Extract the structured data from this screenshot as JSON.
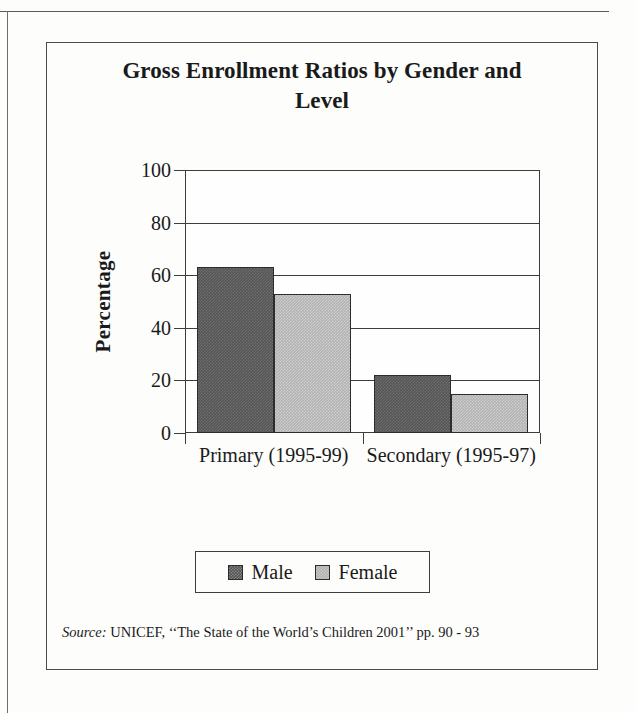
{
  "chart_data": {
    "type": "bar",
    "title": "Gross Enrollment Ratios by Gender and Level",
    "title_line1": "Gross Enrollment Ratios by Gender and",
    "title_line2": "Level",
    "xlabel": "",
    "ylabel": "Percentage",
    "ylim": [
      0,
      100
    ],
    "ytick_labels": [
      "100",
      "80",
      "60",
      "40",
      "20",
      "0"
    ],
    "yticks": [
      100,
      80,
      60,
      40,
      20,
      0
    ],
    "grid": true,
    "legend_position": "bottom-center",
    "categories": [
      "Primary (1995-99)",
      "Secondary (1995-97)"
    ],
    "series": [
      {
        "name": "Male",
        "color": "#565656",
        "values": [
          63,
          22
        ]
      },
      {
        "name": "Female",
        "color": "#b3b3b3",
        "values": [
          53,
          15
        ]
      }
    ]
  },
  "legend": {
    "items": [
      {
        "label": "Male",
        "swatch": "male-swatch"
      },
      {
        "label": "Female",
        "swatch": "female-swatch"
      }
    ]
  },
  "source": {
    "label": "Source:",
    "text": "UNICEF, ‘‘The State of the World’s Children 2001’’ pp. 90 - 93"
  },
  "colors": {
    "male": "#565656",
    "female": "#b3b3b3",
    "axis": "#3d3d3d",
    "frame": "#4a4a4a",
    "text": "#1a1a1a",
    "background": "#fdfdfc"
  }
}
